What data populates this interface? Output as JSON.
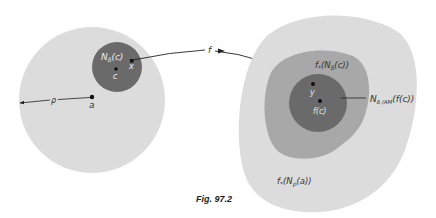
{
  "figure": {
    "caption": "Fig. 97.2",
    "colors": {
      "background": "#ffffff",
      "light_region": "#dcdcdc",
      "mid_region": "#a8a8a8",
      "dark_region": "#6a6a6a",
      "ink": "#222222"
    },
    "left_space": {
      "outer_ball_label": "",
      "radius_label": "ρ",
      "center_point_label": "a",
      "inner_ball_label": "N",
      "inner_ball_sub": "δ",
      "inner_ball_arg": "(c)",
      "inner_center_label": "c",
      "inner_point_label": "x"
    },
    "mapping": {
      "label": "f"
    },
    "right_space": {
      "outer_region_label_f": "f",
      "outer_region_label_star": "*",
      "outer_region_label_N": "(N",
      "outer_region_label_sub": "ρ",
      "outer_region_label_arg": "(a))",
      "mid_region_label_f": "f",
      "mid_region_label_star": "*",
      "mid_region_label_N": "(N",
      "mid_region_label_sub": "δ",
      "mid_region_label_arg": "(c))",
      "inner_ball_label_N": "N",
      "inner_ball_label_sub": "δ /AM",
      "inner_ball_label_arg": "(f(c))",
      "image_point_label": "y",
      "center_point_label": "f(c)"
    }
  }
}
